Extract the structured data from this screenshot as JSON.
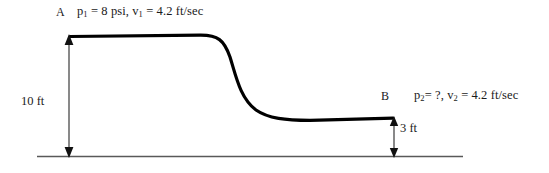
{
  "diagram": {
    "points": [
      {
        "name": "point-a",
        "label": "A",
        "pressure_text": "p",
        "pressure_sub": "1",
        "pressure_value": " = 8 psi,  ",
        "velocity_text": "v",
        "velocity_sub": "1",
        "velocity_value": " = 4.2 ft/sec",
        "full_text": "p1 = 8 psi,  v1 = 4.2 ft/sec"
      },
      {
        "name": "point-b",
        "label": "B",
        "pressure_text": "p",
        "pressure_sub": "2",
        "pressure_value": "= ?,  ",
        "velocity_text": "v",
        "velocity_sub": "2",
        "velocity_value": " = 4.2 ft/sec",
        "full_text": "p2= ?,  v2 = 4.2 ft/sec"
      }
    ],
    "dimensions": [
      {
        "name": "upstream-depth",
        "label": "10 ft",
        "value": 10,
        "unit": "ft"
      },
      {
        "name": "downstream-depth",
        "label": "3 ft",
        "value": 3,
        "unit": "ft"
      }
    ],
    "colors": {
      "surface_curve": "#000000",
      "ground_line": "#595959",
      "dimension_arrow": "#1a1a1a",
      "text": "#1a1a1a",
      "background": "#ffffff"
    },
    "geometry": {
      "upper_surface_y": 36,
      "lower_surface_y": 118,
      "ground_y": 156,
      "left_dim_x": 69,
      "right_dim_x": 394,
      "ground_start_x": 37,
      "ground_end_x": 463
    }
  }
}
